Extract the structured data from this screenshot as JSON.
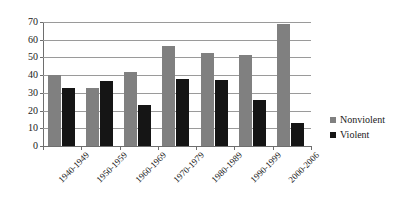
{
  "chart_data": {
    "type": "bar",
    "title": "",
    "subtitle": "",
    "xlabel": "",
    "ylabel": "",
    "categories": [
      "1940-1949",
      "1950-1959",
      "1960-1969",
      "1970-1979",
      "1980-1989",
      "1990-1999",
      "2000-2006"
    ],
    "series": [
      {
        "name": "Nonviolent",
        "color": "#808080",
        "values": [
          40,
          33,
          42,
          56.5,
          52.5,
          51.5,
          69
        ]
      },
      {
        "name": "Violent",
        "color": "#151515",
        "values": [
          33,
          36.5,
          23,
          38,
          37.5,
          26,
          13
        ]
      }
    ],
    "ylim": [
      0,
      70
    ],
    "yticks": [
      0,
      10,
      20,
      30,
      40,
      50,
      60,
      70
    ],
    "ytick_labels": [
      "0",
      "10",
      "20",
      "30",
      "40",
      "50",
      "60",
      "70"
    ],
    "grid": true,
    "grid_axis": "y",
    "legend_position": "right",
    "legend_entries": [
      "Nonviolent",
      "Violent"
    ],
    "xtick_label_rotation": -45,
    "annotations": []
  }
}
